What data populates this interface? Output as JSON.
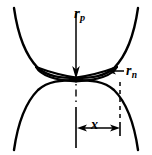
{
  "figure": {
    "background_color": "#ffffff",
    "stroke_color": "#000000",
    "width": 152,
    "height": 155,
    "labels": {
      "particle_radius": {
        "symbol": "r",
        "subscript": "p"
      },
      "neck_radius": {
        "symbol": "r",
        "subscript": "n"
      },
      "neck_half_width": {
        "symbol": "x",
        "subscript": ""
      }
    },
    "annotations": [
      {
        "name": "particle-radius-annotation",
        "symbol": "r",
        "subscript": "p",
        "arrow": "down",
        "description": "Vertical arrow along the axis of symmetry from top of upper particle to the neck plane"
      },
      {
        "name": "neck-radius-annotation",
        "symbol": "r",
        "subscript": "n",
        "arrow": "left",
        "description": "Horizontal arrow pointing left to the concave neck surface cusp"
      },
      {
        "name": "neck-half-width-annotation",
        "symbol": "x",
        "arrow": "both",
        "description": "Horizontal dimension from the axis of symmetry to the neck edge"
      }
    ],
    "geometry": {
      "type": "two-sphere-sintering-neck",
      "axis_x": 76,
      "neck_plane_y": 78,
      "upper_sphere": {
        "center_x": 76,
        "center_y": -38,
        "radius": 118
      },
      "lower_sphere": {
        "center_x": 76,
        "center_y": 194,
        "radius": 118
      },
      "neck_cusp_left_x": 36,
      "neck_cusp_right_x": 117,
      "neck_edge_x": 120,
      "dimension_line_y": 128
    }
  }
}
